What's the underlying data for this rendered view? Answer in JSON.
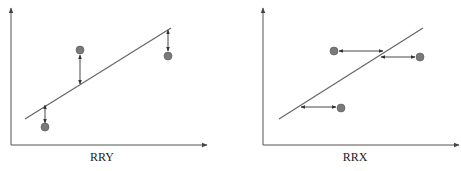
{
  "panels": [
    {
      "id": "rry",
      "label": "RRY",
      "label_pos": [
        102,
        150
      ],
      "axes": {
        "origin": [
          11,
          145
        ],
        "y_top": 8,
        "x_end": 207
      },
      "fit_line": [
        [
          25,
          119
        ],
        [
          171,
          28
        ]
      ],
      "residual_direction": "vertical",
      "points": [
        {
          "cx": 45,
          "cy": 127,
          "arrow": [
            [
              45,
              105
            ],
            [
              45,
              123
            ]
          ]
        },
        {
          "cx": 80,
          "cy": 50,
          "arrow": [
            [
              80,
              55
            ],
            [
              80,
              84
            ]
          ]
        },
        {
          "cx": 168,
          "cy": 56,
          "arrow": [
            [
              168,
              30
            ],
            [
              168,
              51
            ]
          ]
        }
      ]
    },
    {
      "id": "rrx",
      "label": "RRX",
      "label_pos": [
        355,
        150
      ],
      "axes": {
        "origin": [
          263,
          145
        ],
        "y_top": 8,
        "x_end": 459
      },
      "fit_line": [
        [
          279,
          119
        ],
        [
          423,
          28
        ]
      ],
      "residual_direction": "horizontal",
      "points": [
        {
          "cx": 334,
          "cy": 51,
          "arrow": [
            [
              339,
              51
            ],
            [
              383,
              51
            ]
          ]
        },
        {
          "cx": 420,
          "cy": 57,
          "arrow": [
            [
              381,
              57
            ],
            [
              415,
              57
            ]
          ]
        },
        {
          "cx": 341,
          "cy": 108,
          "arrow": [
            [
              301,
              107
            ],
            [
              336,
              107
            ]
          ]
        }
      ]
    }
  ],
  "colors": {
    "axis": "#555555",
    "line": "#666666",
    "point": "#7a7a7a"
  }
}
